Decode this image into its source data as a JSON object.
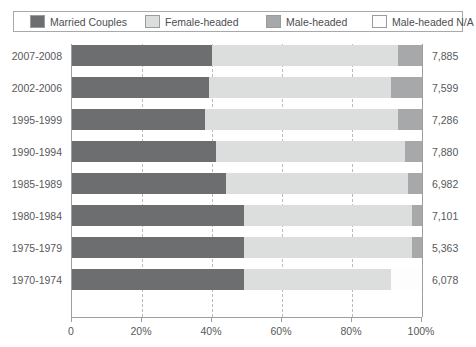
{
  "legend": {
    "items": [
      {
        "label": "Married Couples",
        "key": "married",
        "color": "#6d6e70"
      },
      {
        "label": "Female-headed",
        "key": "female",
        "color": "#dcdddd"
      },
      {
        "label": "Male-headed",
        "key": "male",
        "color": "#a6a8aa"
      },
      {
        "label": "Male-headed N/A",
        "key": "male_na",
        "color": "#fdfdfd"
      }
    ]
  },
  "axis": {
    "x_ticks": [
      "0",
      "20%",
      "40%",
      "60%",
      "80%",
      "100%"
    ],
    "x_tick_values": [
      0,
      20,
      40,
      60,
      80,
      100
    ]
  },
  "chart_data": {
    "type": "bar",
    "orientation": "horizontal",
    "stacked": true,
    "stack_mode": "percent",
    "title": "",
    "xlabel": "",
    "ylabel": "",
    "xlim": [
      0,
      100
    ],
    "grid": true,
    "legend_position": "top",
    "categories": [
      "2007-2008",
      "2002-2006",
      "1995-1999",
      "1990-1994",
      "1985-1989",
      "1980-1984",
      "1975-1979",
      "1970-1974"
    ],
    "series": [
      {
        "name": "Married Couples",
        "color": "#6d6e70",
        "values": [
          40,
          39,
          38,
          41,
          44,
          49,
          49,
          49
        ]
      },
      {
        "name": "Female-headed",
        "color": "#dcdddd",
        "values": [
          53,
          52,
          55,
          54,
          52,
          48,
          48,
          42
        ]
      },
      {
        "name": "Male-headed",
        "color": "#a6a8aa",
        "values": [
          7,
          9,
          7,
          5,
          4,
          3,
          3,
          0
        ]
      },
      {
        "name": "Male-headed N/A",
        "color": "#fdfdfd",
        "values": [
          0,
          0,
          0,
          0,
          0,
          0,
          0,
          9
        ]
      }
    ],
    "totals": [
      "7,885",
      "7,599",
      "7,286",
      "7,880",
      "6,982",
      "7,101",
      "5,363",
      "6,078"
    ],
    "total_values": [
      7885,
      7599,
      7286,
      7880,
      6982,
      7101,
      5363,
      6078
    ]
  }
}
